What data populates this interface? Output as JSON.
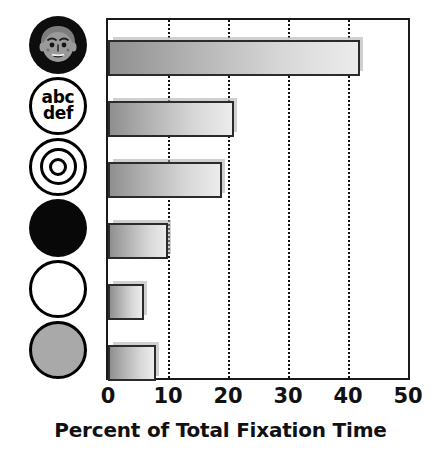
{
  "chart_data": {
    "type": "bar",
    "orientation": "horizontal",
    "title": "",
    "xlabel": "Percent of Total Fixation Time",
    "ylabel": "",
    "xlim": [
      0,
      50
    ],
    "xticks": [
      0,
      10,
      20,
      30,
      40,
      50
    ],
    "xtick_labels": [
      "0",
      "10",
      "20",
      "30",
      "40",
      "50"
    ],
    "grid": "vertical dotted gridlines at 10, 20, 30, 40",
    "legend": "none",
    "categories": [
      "face",
      "text (abc def)",
      "bullseye / concentric circles",
      "solid black circle",
      "white circle",
      "gray circle"
    ],
    "values": [
      42,
      21,
      19,
      10,
      6,
      8
    ],
    "bars": [
      {
        "category": "face",
        "icon": "face-icon",
        "value": 42
      },
      {
        "category": "text (abc def)",
        "icon": "text-abc-def-icon",
        "value": 21
      },
      {
        "category": "bullseye / concentric circles",
        "icon": "bullseye-icon",
        "value": 19
      },
      {
        "category": "solid black circle",
        "icon": "black-circle-icon",
        "value": 10
      },
      {
        "category": "white circle",
        "icon": "white-circle-icon",
        "value": 6
      },
      {
        "category": "gray circle",
        "icon": "gray-circle-icon",
        "value": 8
      }
    ]
  },
  "icons": {
    "text_circle": {
      "line1": "abc",
      "line2": "def"
    }
  },
  "colors": {
    "axis": "#1a1a1a",
    "gridline": "#111111",
    "bar_border": "#2b2b2b",
    "bar_gradient_start": "#8f8f8f",
    "bar_gradient_end": "#ececec",
    "text": "#111111",
    "icon_black": "#080808",
    "icon_gray": "#a9a9a9",
    "background": "#ffffff"
  }
}
